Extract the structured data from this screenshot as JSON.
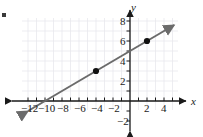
{
  "figure": {
    "width": 203,
    "height": 137,
    "background": "#ffffff",
    "axis_color": "#1a1a1a",
    "grid_color": "#e8e8ee",
    "line_color": "#6b6b6b",
    "point_color": "#111111",
    "x_axis_name": "x",
    "y_axis_name": "y"
  },
  "chart_data": {
    "type": "line",
    "title": "",
    "subtitle": "",
    "xlabel": "x",
    "ylabel": "y",
    "xlim": [
      -13,
      6
    ],
    "ylim": [
      -3,
      9
    ],
    "grid": true,
    "grid_step": 1,
    "legend": "none",
    "x_ticks": [
      -12,
      -10,
      -8,
      -6,
      -4,
      -2,
      2,
      4
    ],
    "x_tick_labels": [
      "-12",
      "-10",
      "-8",
      "-6",
      "-4",
      "-2",
      "2",
      "4"
    ],
    "y_ticks": [
      -2,
      2,
      4,
      6,
      8
    ],
    "y_tick_labels": [
      "-2",
      "2",
      "4",
      "6",
      "8"
    ],
    "series": [
      {
        "name": "line",
        "equation": "y = 0.5x + 5",
        "slope": 0.5,
        "intercept": 5,
        "x_intercept": -10,
        "draw_from": [
          -12.0,
          -1.0
        ],
        "draw_to": [
          5.2,
          7.6
        ],
        "arrow_start": true,
        "arrow_end": true,
        "points": [
          {
            "label": "point-a",
            "x": -4,
            "y": 3
          },
          {
            "label": "point-b",
            "x": 2,
            "y": 6
          }
        ]
      }
    ],
    "annotations": []
  },
  "ticks": {
    "x": [
      {
        "value": -12,
        "label": "-12",
        "px": 28,
        "label_left": 21,
        "label_top": 103
      },
      {
        "value": -10,
        "label": "-10",
        "px": 45,
        "label_left": 38,
        "label_top": 103
      },
      {
        "value": -8,
        "label": "-8",
        "px": 62,
        "label_left": 57,
        "label_top": 103
      },
      {
        "value": -6,
        "label": "-6",
        "px": 79,
        "label_left": 74,
        "label_top": 103
      },
      {
        "value": -4,
        "label": "-4",
        "px": 96,
        "label_left": 91,
        "label_top": 103
      },
      {
        "value": -2,
        "label": "-2",
        "px": 113,
        "label_left": 108,
        "label_top": 103
      },
      {
        "value": 2,
        "label": "2",
        "px": 147,
        "label_left": 144,
        "label_top": 103
      },
      {
        "value": 4,
        "label": "4",
        "px": 164,
        "label_left": 161,
        "label_top": 103
      }
    ],
    "y": [
      {
        "value": 8,
        "label": "8",
        "py": 21,
        "label_left": 120,
        "label_top": 16
      },
      {
        "value": 6,
        "label": "6",
        "py": 41,
        "label_left": 120,
        "label_top": 36
      },
      {
        "value": 4,
        "label": "4",
        "py": 61,
        "label_left": 120,
        "label_top": 56
      },
      {
        "value": 2,
        "label": "2",
        "py": 81,
        "label_left": 120,
        "label_top": 76
      },
      {
        "value": -2,
        "label": "-2",
        "py": 121,
        "label_left": 117,
        "label_top": 116
      }
    ]
  },
  "axis_labels": {
    "x_name": "x",
    "x_name_left": 191,
    "x_name_top": 96,
    "y_name": "y",
    "y_name_left": 131,
    "y_name_top": 2
  }
}
